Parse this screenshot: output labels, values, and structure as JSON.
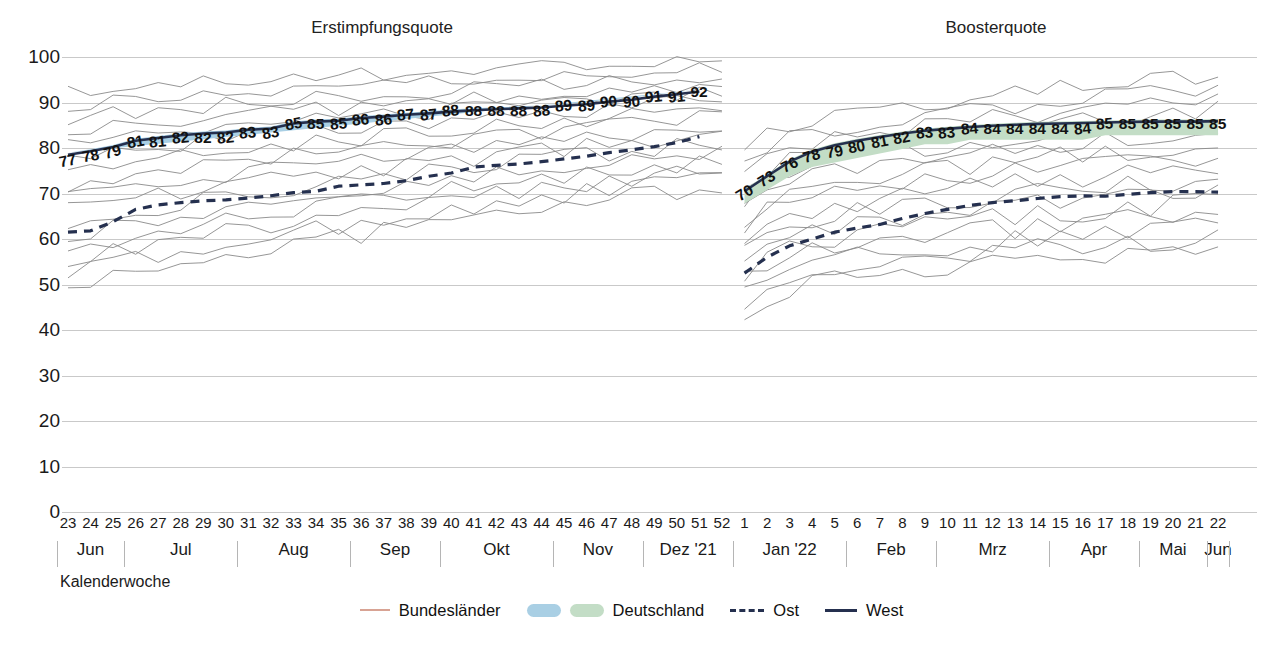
{
  "axis": {
    "caption": "Kalenderwoche",
    "y_ticks": [
      100,
      90,
      80,
      70,
      60,
      50,
      40,
      30,
      20,
      10,
      0
    ],
    "y_min": 0,
    "y_max": 100
  },
  "panels": [
    {
      "key": "erst",
      "title": "Erstimpfungsquote"
    },
    {
      "key": "boost",
      "title": "Boosterquote"
    }
  ],
  "legend": [
    {
      "name": "bundeslaender",
      "label": "Bundesländer",
      "swatch": "thin-line",
      "color": "#d8a394"
    },
    {
      "name": "deutschland",
      "label": "Deutschland",
      "swatch": "pill-pair",
      "color": "#a9cfe4",
      "color2": "#c3ddc6"
    },
    {
      "name": "ost",
      "label": "Ost",
      "swatch": "dashed-line",
      "color": "#25304f"
    },
    {
      "name": "west",
      "label": "West",
      "swatch": "solid-line",
      "color": "#25304f"
    }
  ],
  "weeks": [
    "23",
    "24",
    "25",
    "26",
    "27",
    "28",
    "29",
    "30",
    "31",
    "32",
    "33",
    "34",
    "35",
    "36",
    "37",
    "38",
    "39",
    "40",
    "41",
    "42",
    "43",
    "44",
    "45",
    "46",
    "47",
    "48",
    "49",
    "50",
    "51",
    "52",
    "1",
    "2",
    "3",
    "4",
    "5",
    "6",
    "7",
    "8",
    "9",
    "10",
    "11",
    "12",
    "13",
    "14",
    "15",
    "16",
    "17",
    "18",
    "19",
    "20",
    "21",
    "22"
  ],
  "months": [
    {
      "label": "Jun",
      "start": 0,
      "end": 2
    },
    {
      "label": "Jul",
      "start": 3,
      "end": 7
    },
    {
      "label": "Aug",
      "start": 8,
      "end": 12
    },
    {
      "label": "Sep",
      "start": 13,
      "end": 16
    },
    {
      "label": "Okt",
      "start": 17,
      "end": 21
    },
    {
      "label": "Nov",
      "start": 22,
      "end": 25
    },
    {
      "label": "Dez '21",
      "start": 26,
      "end": 29
    },
    {
      "label": "Jan '22",
      "start": 30,
      "end": 34
    },
    {
      "label": "Feb",
      "start": 35,
      "end": 38
    },
    {
      "label": "Mrz",
      "start": 39,
      "end": 43
    },
    {
      "label": "Apr",
      "start": 44,
      "end": 47
    },
    {
      "label": "Mai",
      "start": 48,
      "end": 50
    },
    {
      "label": "Jun",
      "start": 51,
      "end": 51
    }
  ],
  "chart_data": {
    "type": "line",
    "xlabel": "Kalenderwoche",
    "ylabel": "",
    "ylim": [
      0,
      100
    ],
    "grid": true,
    "legend_position": "bottom",
    "panels": [
      {
        "name": "Erstimpfungsquote",
        "x_index_start": 0,
        "x_index_end": 29,
        "series": [
          {
            "name": "Deutschland",
            "role": "band-labels",
            "color": "#a9cfe4",
            "values": [
              77,
              78,
              79,
              81,
              81,
              82,
              82,
              82,
              83,
              83,
              85,
              85,
              85,
              86,
              86,
              87,
              87,
              88,
              88,
              88,
              88,
              88,
              89,
              89,
              90,
              90,
              91,
              91,
              92
            ],
            "labels": [
              "77",
              "78",
              "79",
              "81",
              "81",
              "82",
              "82",
              "82",
              "83",
              "83",
              "85",
              "85",
              "85",
              "86",
              "86",
              "87",
              "87",
              "88",
              "88",
              "88",
              "88",
              "88",
              "89",
              "89",
              "90",
              "90",
              "91",
              "91",
              "92"
            ]
          },
          {
            "name": "West",
            "role": "line-solid",
            "color": "#25304f",
            "values": [
              78.5,
              79.3,
              80.2,
              81.6,
              82.2,
              82.8,
              83.2,
              83.4,
              84.0,
              84.3,
              85.4,
              85.8,
              86.0,
              86.6,
              86.9,
              87.3,
              87.6,
              88.0,
              88.3,
              88.5,
              88.7,
              88.9,
              89.3,
              89.6,
              90.2,
              90.6,
              91.3,
              91.8,
              92.4
            ]
          },
          {
            "name": "Ost",
            "role": "line-dashed",
            "color": "#25304f",
            "values": [
              61.5,
              61.8,
              63.8,
              66.5,
              67.5,
              68.0,
              68.4,
              68.6,
              69.0,
              69.5,
              70.2,
              70.5,
              71.6,
              71.9,
              72.2,
              72.8,
              73.8,
              74.5,
              75.8,
              76.2,
              76.5,
              77.0,
              77.6,
              78.2,
              79.0,
              79.6,
              80.3,
              81.2,
              82.5
            ]
          },
          {
            "name": "Bundesländer",
            "role": "thin-lines",
            "color": "#8a8a8a",
            "count": 16,
            "range_start": [
              49,
              92
            ],
            "range_end": [
              72,
              100
            ]
          }
        ]
      },
      {
        "name": "Boosterquote",
        "x_index_start": 30,
        "x_index_end": 51,
        "series": [
          {
            "name": "Deutschland",
            "role": "band-labels",
            "color": "#c3ddc6",
            "values": [
              70,
              73,
              76,
              78,
              79,
              80,
              81,
              82,
              83,
              83,
              84,
              84,
              84,
              84,
              84,
              84,
              85,
              85,
              85,
              85,
              85,
              85
            ],
            "labels": [
              "70",
              "73",
              "76",
              "78",
              "79",
              "80",
              "81",
              "82",
              "83",
              "83",
              "84",
              "84",
              "84",
              "84",
              "84",
              "84",
              "85",
              "85",
              "85",
              "85",
              "85",
              "85"
            ]
          },
          {
            "name": "West",
            "role": "line-solid",
            "color": "#25304f",
            "values": [
              70.5,
              73.8,
              77.0,
              79.2,
              80.6,
              81.6,
              82.4,
              83.2,
              83.8,
              84.2,
              84.6,
              84.9,
              85.1,
              85.3,
              85.4,
              85.5,
              85.6,
              85.7,
              85.8,
              85.8,
              85.8,
              85.9
            ]
          },
          {
            "name": "Ost",
            "role": "line-dashed",
            "color": "#25304f",
            "values": [
              52.5,
              56.0,
              58.5,
              60.0,
              61.5,
              62.4,
              63.2,
              64.5,
              65.6,
              66.5,
              67.4,
              68.0,
              68.4,
              68.9,
              69.3,
              69.5,
              69.4,
              69.8,
              70.2,
              70.4,
              70.4,
              70.3
            ]
          },
          {
            "name": "Bundesländer",
            "role": "thin-lines",
            "color": "#8a8a8a",
            "count": 16,
            "range_start": [
              44,
              78
            ],
            "range_end": [
              58,
              96
            ]
          }
        ]
      }
    ]
  }
}
